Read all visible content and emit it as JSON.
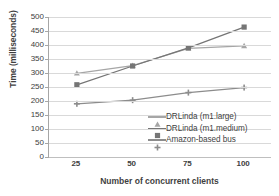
{
  "chart_data": {
    "type": "line",
    "title": "",
    "xlabel": "Number of concurrent clients",
    "ylabel": "Time (milliseconds)",
    "x": [
      25,
      50,
      75,
      100
    ],
    "xticklabels": [
      "25",
      "50",
      "75",
      "100"
    ],
    "yticklabels": [
      "500",
      "450",
      "400",
      "350",
      "300",
      "250",
      "200",
      "150",
      "100",
      "50",
      "0"
    ],
    "ylim": [
      0,
      500
    ],
    "ytick_step": 50,
    "xlim": [
      12.5,
      112.5
    ],
    "grid": "horizontal",
    "legend_position": "inside-lower-right",
    "series": [
      {
        "name": "DRLinda (m1.large)",
        "values": [
          299,
          326,
          388,
          397
        ],
        "color": "#a6a6a6",
        "marker": "triangle"
      },
      {
        "name": "DRLinda (m1.medium)",
        "values": [
          258,
          325,
          390,
          464
        ],
        "color": "#757575",
        "marker": "square"
      },
      {
        "name": "Amazon-based bus",
        "values": [
          190,
          203,
          230,
          248
        ],
        "color": "#8c8c8c",
        "marker": "plus"
      }
    ]
  },
  "axis": {
    "line_color": "#a6a6a6",
    "grid_color": "#d9d9d9"
  }
}
